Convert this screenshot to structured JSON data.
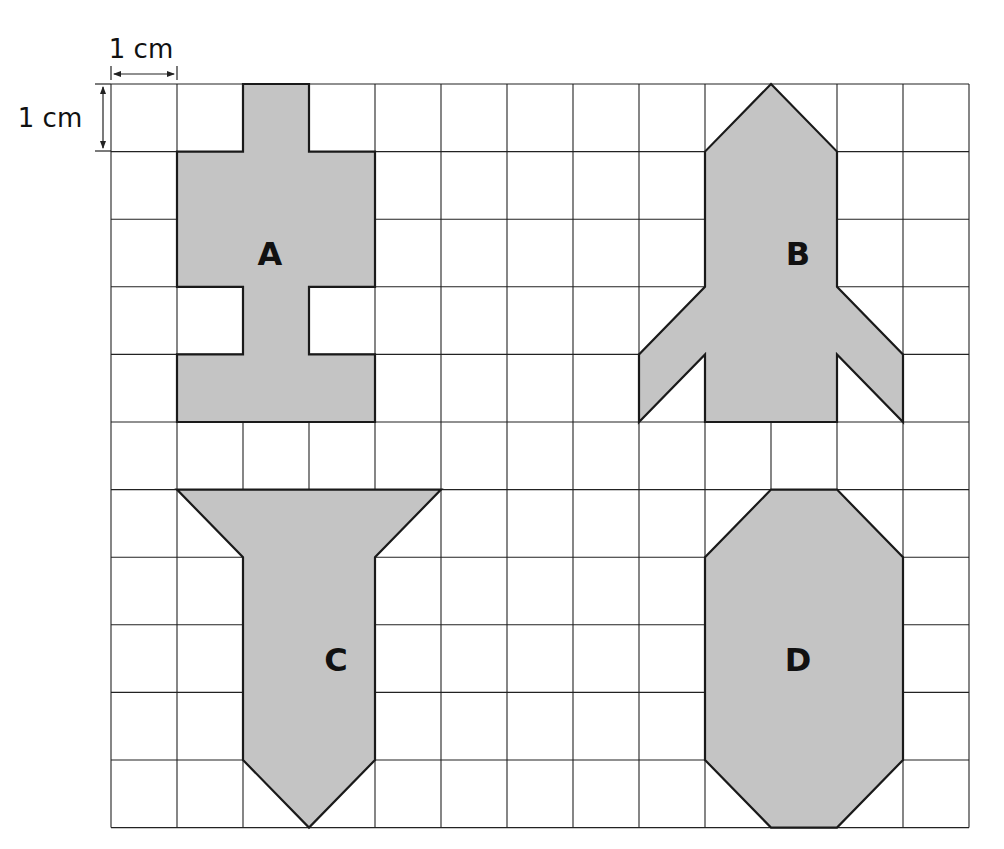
{
  "scale": {
    "horizontal_label": "1 cm",
    "vertical_label": "1 cm"
  },
  "grid": {
    "columns": 13,
    "rows": 11,
    "line_color": "#222222",
    "background": "#ffffff"
  },
  "colors": {
    "shape_fill": "#c4c4c4",
    "shape_stroke": "#1a1a1a",
    "text": "#111111"
  },
  "shapes": [
    {
      "label": "A",
      "label_pos": [
        2.5,
        2.5
      ],
      "points": [
        [
          2,
          0
        ],
        [
          3,
          0
        ],
        [
          3,
          1
        ],
        [
          4,
          1
        ],
        [
          4,
          3
        ],
        [
          3,
          3
        ],
        [
          3,
          4
        ],
        [
          4,
          4
        ],
        [
          4,
          5
        ],
        [
          1,
          5
        ],
        [
          1,
          4
        ],
        [
          2,
          4
        ],
        [
          2,
          3
        ],
        [
          1,
          3
        ],
        [
          1,
          1
        ],
        [
          2,
          1
        ]
      ]
    },
    {
      "label": "B",
      "label_pos": [
        10.5,
        2.5
      ],
      "points": [
        [
          10,
          0
        ],
        [
          11,
          1
        ],
        [
          11,
          3
        ],
        [
          12,
          4
        ],
        [
          12,
          5
        ],
        [
          11,
          4
        ],
        [
          11,
          5
        ],
        [
          9,
          5
        ],
        [
          9,
          4
        ],
        [
          8,
          5
        ],
        [
          8,
          4
        ],
        [
          9,
          3
        ],
        [
          9,
          1
        ]
      ]
    },
    {
      "label": "C",
      "label_pos": [
        3.5,
        8.5
      ],
      "points": [
        [
          1,
          6
        ],
        [
          5,
          6
        ],
        [
          4,
          7
        ],
        [
          4,
          10
        ],
        [
          3,
          11
        ],
        [
          2,
          10
        ],
        [
          2,
          7
        ]
      ]
    },
    {
      "label": "D",
      "label_pos": [
        10.5,
        8.5
      ],
      "points": [
        [
          10,
          6
        ],
        [
          11,
          6
        ],
        [
          12,
          7
        ],
        [
          12,
          10
        ],
        [
          11,
          11
        ],
        [
          10,
          11
        ],
        [
          9,
          10
        ],
        [
          9,
          7
        ]
      ]
    }
  ]
}
